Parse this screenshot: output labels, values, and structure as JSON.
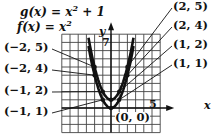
{
  "chart_data": {
    "type": "line",
    "title": "",
    "equations": [
      "g(x) = x² + 1",
      "f(x) = x²"
    ],
    "xlabel": "x",
    "ylabel": "y",
    "tick_labels": {
      "x": [
        "5"
      ],
      "y": [
        "7"
      ]
    },
    "xlim": [
      -6,
      6
    ],
    "ylim": [
      -3,
      9
    ],
    "grid": true,
    "series": [
      {
        "name": "f(x) = x²",
        "x": [
          -2,
          -1,
          0,
          1,
          2
        ],
        "y": [
          4,
          1,
          0,
          1,
          4
        ]
      },
      {
        "name": "g(x) = x² + 1",
        "x": [
          -2,
          -1,
          0,
          1,
          2
        ],
        "y": [
          5,
          2,
          1,
          2,
          5
        ]
      }
    ],
    "annotations": [
      "(2, 5)",
      "(2, 4)",
      "(1, 2)",
      "(1, 1)",
      "(−2, 5)",
      "(−2, 4)",
      "(−1, 2)",
      "(−1, 1)",
      "(0, 0)"
    ]
  },
  "labels": {
    "g_eq": "g(x) = x",
    "f_eq": "f(x) = x",
    "sup2": "2",
    "g_plus": " + 1",
    "y_axis": "y",
    "x_axis": "x",
    "tick_7": "7",
    "tick_5": "5",
    "p_2_5": "(2, 5)",
    "p_2_4": "(2, 4)",
    "p_1_2": "(1, 2)",
    "p_1_1": "(1, 1)",
    "p_m2_5": "(−2, 5)",
    "p_m2_4": "(−2, 4)",
    "p_m1_2": "(−1, 2)",
    "p_m1_1": "(−1, 1)",
    "p_0_0": "(0, 0)"
  }
}
